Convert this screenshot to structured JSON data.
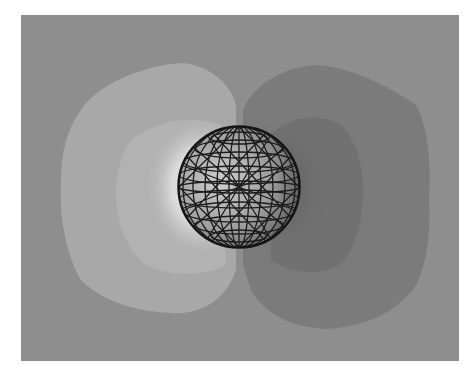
{
  "figure": {
    "colors": {
      "background": "#8e8e8e",
      "light_lobe_outer": "#a6a6a6",
      "light_lobe_inner": "#b4b4b4",
      "light_glow": "#e8e8e8",
      "dark_lobe_outer": "#7a7a7a",
      "dark_lobe_inner": "#6e6e6e",
      "mesh_line": "#1a1a1a",
      "sphere_fill": "#9a9a9a"
    },
    "sphere": {
      "cx": 218,
      "cy": 172,
      "r": 61
    }
  }
}
